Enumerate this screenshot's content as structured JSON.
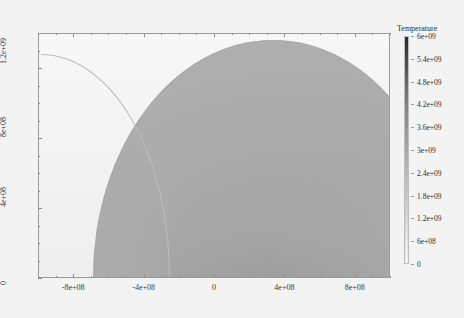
{
  "chart_data": {
    "type": "heatmap",
    "title": "",
    "xlabel": "",
    "ylabel": "",
    "xlim": [
      -1000000000,
      1000000000
    ],
    "ylim": [
      0,
      1400000000
    ],
    "grid": false,
    "xticks": [
      {
        "value": -800000000,
        "label": "-8e+08"
      },
      {
        "value": -400000000,
        "label": "-4e+08"
      },
      {
        "value": 0,
        "label": "0"
      },
      {
        "value": 400000000,
        "label": "4e+08"
      },
      {
        "value": 800000000,
        "label": "8e+08"
      }
    ],
    "yticks": [
      {
        "value": 0,
        "label": "0"
      },
      {
        "value": 400000000,
        "label": "4e+08"
      },
      {
        "value": 800000000,
        "label": "8e+08"
      },
      {
        "value": 1200000000,
        "label": "1.2e+09"
      }
    ],
    "colorbar": {
      "title": "Temperature",
      "vmin": 0,
      "vmax": 6000000000,
      "orientation": "vertical",
      "position": "right",
      "colormap": "grayscale-inverted",
      "ticks": [
        {
          "value": 6000000000,
          "label": "6e+09"
        },
        {
          "value": 5400000000,
          "label": "5.4e+09"
        },
        {
          "value": 4800000000,
          "label": "4.8e+09"
        },
        {
          "value": 4200000000,
          "label": "4.2e+09"
        },
        {
          "value": 3600000000,
          "label": "3.6e+09"
        },
        {
          "value": 3000000000,
          "label": "3e+09"
        },
        {
          "value": 2400000000,
          "label": "2.4e+09"
        },
        {
          "value": 1800000000,
          "label": "1.8e+09"
        },
        {
          "value": 1200000000,
          "label": "1.2e+09"
        },
        {
          "value": 600000000,
          "label": "6e+08"
        },
        {
          "value": 0,
          "label": "0"
        }
      ]
    },
    "features": [
      {
        "name": "shocked-dome",
        "shape": "hemispherical-blast-region",
        "fill": "#a9a9a9"
      },
      {
        "name": "shock-front",
        "shape": "arc",
        "stroke": "#b9b9b9"
      },
      {
        "name": "ambient-medium",
        "fill": "#f2f2f2"
      }
    ],
    "colors": {
      "background": "#f3f3f3",
      "frame": "#9a9a9a",
      "dome_fill": "#a9a9a9",
      "text": "#2d2d2d",
      "colorbar_high": "#2b2b2b",
      "colorbar_low": "#f1f1f1"
    }
  }
}
